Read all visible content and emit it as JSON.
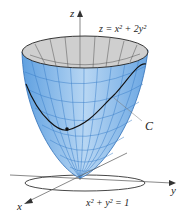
{
  "figure": {
    "surface_label": "z = x² + 2y²",
    "curve_label": "C",
    "cylinder_label": "x² + y² = 1",
    "axes": {
      "x": "x",
      "y": "y",
      "z": "z"
    }
  },
  "colors": {
    "surface_fill": "#a9cdf0",
    "surface_mesh": "#3b7fc9",
    "inner_surface": "#c8c8c8",
    "curve": "#111111",
    "axes": "#444444"
  }
}
